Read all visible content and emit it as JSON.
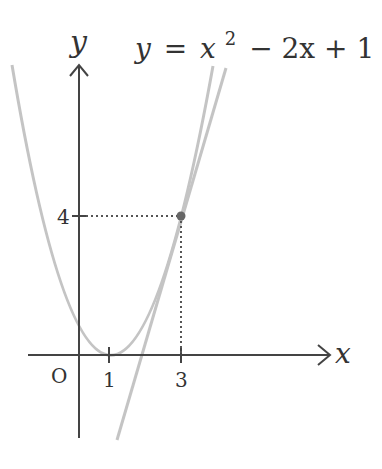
{
  "equation": {
    "lhs": "y",
    "eq": "=",
    "x": "x",
    "exp": "2",
    "rest": "− 2x + 1"
  },
  "axes": {
    "x_label": "x",
    "y_label": "y",
    "origin_label": "O"
  },
  "ticks": {
    "x": [
      "1",
      "3"
    ],
    "y": [
      "4"
    ]
  },
  "point": {
    "x": 3,
    "y": 4
  },
  "colors": {
    "axis": "#444444",
    "curve": "#c0c0c0",
    "tangent": "#c0c0c0",
    "point": "#666666",
    "dotted": "#555555"
  }
}
